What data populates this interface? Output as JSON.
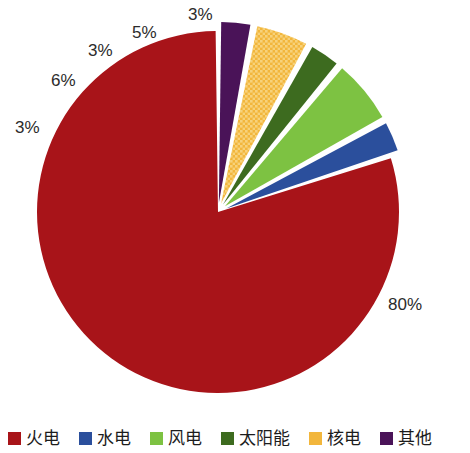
{
  "chart_data": {
    "type": "pie",
    "title": "",
    "subtitle": "",
    "xlabel": "",
    "ylabel": "",
    "legend_position": "bottom",
    "grid": false,
    "categories": [
      "火电",
      "水电",
      "风电",
      "太阳能",
      "核电",
      "其他"
    ],
    "values": [
      80,
      3,
      6,
      3,
      5,
      3
    ],
    "value_labels": [
      "80%",
      "3%",
      "6%",
      "3%",
      "5%",
      "3%"
    ],
    "colors": [
      "#A81419",
      "#2B4F9C",
      "#7DC242",
      "#3D6B1F",
      "#F2B63C",
      "#4A1358"
    ],
    "exploded": [
      false,
      true,
      true,
      true,
      true,
      true
    ],
    "textures": [
      "solid",
      "solid",
      "solid",
      "solid",
      "crosshatch",
      "solid"
    ],
    "start_angle_deg": 270,
    "direction": "counterclockwise",
    "slices": [
      {
        "name": "火电",
        "value": 80,
        "label": "80%",
        "color": "#A81419",
        "exploded": false,
        "texture": "solid"
      },
      {
        "name": "水电",
        "value": 3,
        "label": "3%",
        "color": "#2B4F9C",
        "exploded": true,
        "texture": "solid"
      },
      {
        "name": "风电",
        "value": 6,
        "label": "6%",
        "color": "#7DC242",
        "exploded": true,
        "texture": "solid"
      },
      {
        "name": "太阳能",
        "value": 3,
        "label": "3%",
        "color": "#3D6B1F",
        "exploded": true,
        "texture": "solid"
      },
      {
        "name": "核电",
        "value": 5,
        "label": "5%",
        "color": "#F2B63C",
        "exploded": true,
        "texture": "crosshatch"
      },
      {
        "name": "其他",
        "value": 3,
        "label": "3%",
        "color": "#4A1358",
        "exploded": true,
        "texture": "solid"
      }
    ]
  },
  "legend": {
    "items": [
      {
        "label": "火电",
        "color": "#A81419"
      },
      {
        "label": "水电",
        "color": "#2B4F9C"
      },
      {
        "label": "风电",
        "color": "#7DC242"
      },
      {
        "label": "太阳能",
        "color": "#3D6B1F"
      },
      {
        "label": "核电",
        "color": "#F2B63C"
      },
      {
        "label": "其他",
        "color": "#4A1358"
      }
    ]
  },
  "labels": {
    "thermal_pct": "80%",
    "hydro_pct": "3%",
    "wind_pct": "6%",
    "solar_pct": "3%",
    "nuclear_pct": "5%",
    "other_pct": "3%"
  }
}
